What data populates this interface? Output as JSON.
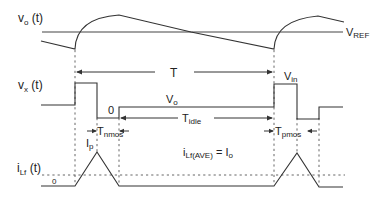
{
  "labels": {
    "vo_main": "v",
    "vo_sub": "o",
    "vo_arg": " (t)",
    "vref_main": "V",
    "vref_sub": "REF",
    "vx_main": "v",
    "vx_sub": "x",
    "vx_arg": " (t)",
    "ilf_main": "i",
    "ilf_sub": "Lf",
    "ilf_arg": " (t)",
    "period": "T",
    "vin_main": "V",
    "vin_sub": "in",
    "vo_level_main": "V",
    "vo_level_sub": "o",
    "zero_v": "0",
    "tidle_main": "T",
    "tidle_sub": "idle",
    "ip_main": "I",
    "ip_sub": "p",
    "tnmos_main": "T",
    "tnmos_sub": "nmos",
    "tpmos_main": "T",
    "tpmos_sub": "pmos",
    "zero_i": "0",
    "iave_main": "i",
    "iave_sub": "Lf(AVE)",
    "iave_eq": " = I",
    "iave_eq_sub": "o"
  },
  "colors": {
    "stroke": "#333333",
    "background": "#ffffff"
  }
}
